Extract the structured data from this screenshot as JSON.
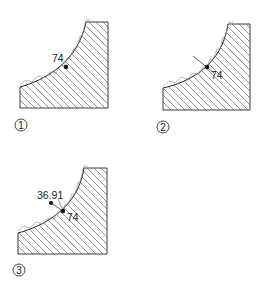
{
  "figures": [
    {
      "id": "1",
      "step_label": "1",
      "dimension_label": "74"
    },
    {
      "id": "2",
      "step_label": "2",
      "dimension_label": "74"
    },
    {
      "id": "3",
      "step_label": "3",
      "dimension_label": "74",
      "secondary_label": "36.91"
    }
  ],
  "colors": {
    "line": "#3a3a3a",
    "background": "#ffffff"
  }
}
